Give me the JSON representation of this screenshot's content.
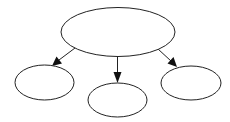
{
  "diagram": {
    "type": "tree",
    "background": "#ffffff",
    "stroke_color": "#222222",
    "arrow_color": "#111111",
    "nodes": [
      {
        "id": "root",
        "shape": "ellipse",
        "label": "",
        "cx": 118,
        "cy": 32,
        "rx": 57,
        "ry": 24.5
      },
      {
        "id": "left",
        "shape": "ellipse",
        "label": "",
        "cx": 44.5,
        "cy": 82.5,
        "rx": 29.5,
        "ry": 17.5
      },
      {
        "id": "middle",
        "shape": "ellipse",
        "label": "",
        "cx": 117.5,
        "cy": 100,
        "rx": 29.5,
        "ry": 17
      },
      {
        "id": "right",
        "shape": "ellipse",
        "label": "",
        "cx": 191,
        "cy": 83,
        "rx": 30,
        "ry": 17
      }
    ],
    "edges": [
      {
        "from": "root",
        "to": "left",
        "directed": true
      },
      {
        "from": "root",
        "to": "middle",
        "directed": true
      },
      {
        "from": "root",
        "to": "right",
        "directed": true
      }
    ]
  }
}
